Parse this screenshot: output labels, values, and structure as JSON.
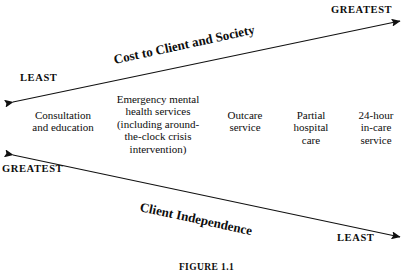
{
  "figure": {
    "caption": "FIGURE 1.1",
    "axes": [
      {
        "id": "cost",
        "title": "Cost to Client and Society",
        "direction": "left-to-right-ascending",
        "low_end_label": "LEAST",
        "high_end_label": "GREATEST",
        "low_end_position": "left",
        "high_end_position": "right"
      },
      {
        "id": "independence",
        "title": "Client Independence",
        "direction": "left-to-right-descending",
        "low_end_label": "LEAST",
        "high_end_label": "GREATEST",
        "low_end_position": "right",
        "high_end_position": "left"
      }
    ],
    "corner_labels": {
      "top_right": "GREATEST",
      "top_left": "LEAST",
      "bottom_left": "GREATEST",
      "bottom_right": "LEAST"
    },
    "services": [
      {
        "label": "Consultation and education"
      },
      {
        "label": "Emergency mental health services (including around-the-clock crisis intervention)"
      },
      {
        "label": "Outcare service"
      },
      {
        "label": "Partial hospital care"
      },
      {
        "label": "24-hour in-care service"
      }
    ],
    "service_lines": [
      [
        "Consultation",
        "and education"
      ],
      [
        "Emergency mental",
        "health services",
        "(including around-",
        "the-clock crisis",
        "intervention)"
      ],
      [
        "Outcare",
        "service"
      ],
      [
        "Partial",
        "hospital",
        "care"
      ],
      [
        "24-hour",
        "in-care",
        "service"
      ]
    ],
    "colors": {
      "background": "#ffffff",
      "ink": "#0d0d0d",
      "arrow": "#111111"
    }
  }
}
